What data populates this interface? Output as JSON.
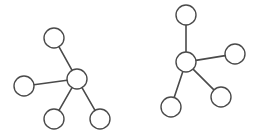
{
  "diagram": {
    "type": "graph",
    "style": {
      "stroke_color": "#4a4a4a",
      "fill_color": "#ffffff",
      "background": "#ffffff",
      "node_radius": 10
    },
    "graphs": [
      {
        "id": "left-star",
        "nodes": [
          {
            "id": "c",
            "x": 77,
            "y": 79
          },
          {
            "id": "top",
            "x": 54,
            "y": 38
          },
          {
            "id": "left",
            "x": 24,
            "y": 86
          },
          {
            "id": "bl",
            "x": 54,
            "y": 119
          },
          {
            "id": "br",
            "x": 100,
            "y": 119
          }
        ],
        "edges": [
          [
            "c",
            "top"
          ],
          [
            "c",
            "left"
          ],
          [
            "c",
            "bl"
          ],
          [
            "c",
            "br"
          ]
        ]
      },
      {
        "id": "right-star",
        "nodes": [
          {
            "id": "c",
            "x": 186,
            "y": 62
          },
          {
            "id": "top",
            "x": 186,
            "y": 15
          },
          {
            "id": "right",
            "x": 235,
            "y": 54
          },
          {
            "id": "br",
            "x": 221,
            "y": 97
          },
          {
            "id": "bl",
            "x": 171,
            "y": 107
          }
        ],
        "edges": [
          [
            "c",
            "top"
          ],
          [
            "c",
            "right"
          ],
          [
            "c",
            "br"
          ],
          [
            "c",
            "bl"
          ]
        ]
      }
    ]
  }
}
